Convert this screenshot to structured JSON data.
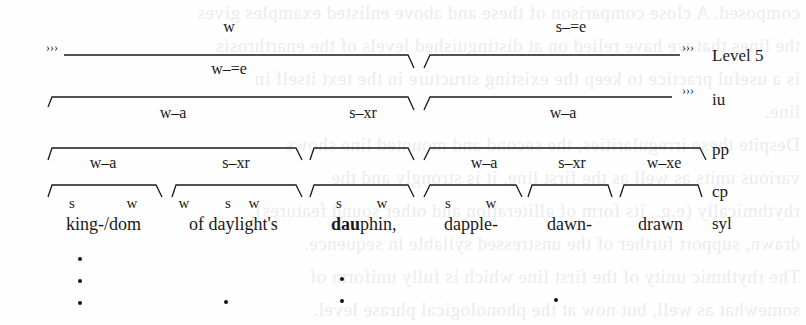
{
  "diagram": {
    "level_labels": {
      "level5": "Level 5",
      "iu": "iu",
      "pp": "pp",
      "cp": "cp",
      "syl": "syl"
    },
    "continuation_marks": {
      "left_level5": "›››",
      "right_level5": "›››",
      "right_iu": "›››"
    },
    "level5": {
      "left_above": "w",
      "left_below": "w–=e",
      "right_above": "s–=e"
    },
    "iu": {
      "left": "w–a",
      "middle": "s–xr",
      "right": "w–a"
    },
    "pp": {
      "group1_left": "w–a",
      "group1_right": "s–xr",
      "group3_left": "w–a",
      "group3_mid": "s–xr",
      "group3_right": "w–xe"
    },
    "cp": {
      "g1": [
        "s",
        "w"
      ],
      "g2": [
        "w",
        "s",
        "w"
      ],
      "g3": [
        "s",
        "w"
      ],
      "g4": [
        "s",
        "w"
      ]
    },
    "words": {
      "w1": "king-/dom",
      "w2": "of daylight's",
      "w3_bold": "dau",
      "w3_rest": "phin,",
      "w4": "dapple-",
      "w5": "dawn-",
      "w6": "drawn"
    },
    "ghost_text": [
      "composed. A close comparison of these and above enlisted examples gives",
      "the lines that we have relied on at distinguished levels of the enarthrosis",
      "is a useful practice to keep the existing structure in the text itself in",
      "line.",
      "Despite these irregularities, the second and mounted line shows",
      "various units as well as the first line, it is strongly and the",
      "rhythmically (e.g., its form of alliteration and other sound features),",
      "drawn, support further of the unstressed syllable in sequence.",
      "The rhythmic unity of the first line which is fully uniform of",
      "somewhat as well, but now at the phonological phrase level."
    ]
  }
}
